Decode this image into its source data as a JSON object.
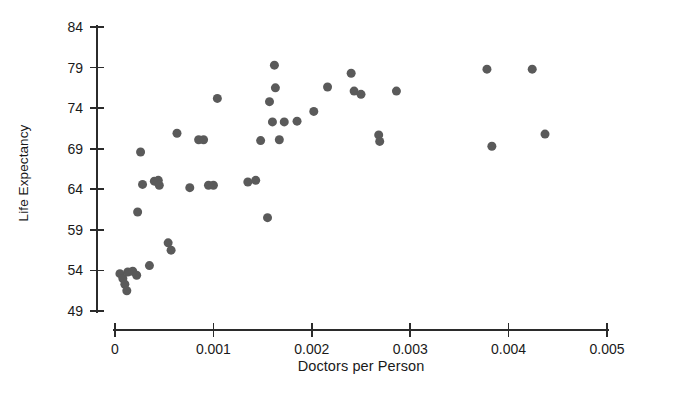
{
  "chart_data": {
    "type": "scatter",
    "title": "",
    "xlabel": "Doctors per Person",
    "ylabel": "Life Expectancy",
    "xlim": [
      0,
      0.005
    ],
    "ylim": [
      49,
      84
    ],
    "xticks": [
      "0",
      "0.001",
      "0.002",
      "0.003",
      "0.004",
      "0.005"
    ],
    "xtick_values": [
      0,
      0.001,
      0.002,
      0.003,
      0.004,
      0.005
    ],
    "yticks": [
      "49",
      "54",
      "59",
      "64",
      "69",
      "74",
      "79",
      "84"
    ],
    "ytick_values": [
      49,
      54,
      59,
      64,
      69,
      74,
      79,
      84
    ],
    "grid": false,
    "legend": null,
    "marker": {
      "shape": "circle",
      "color": "#5a5a5a",
      "size_px": 9
    },
    "point_count": 45,
    "points": [
      {
        "x": 5e-05,
        "y": 53.6
      },
      {
        "x": 8e-05,
        "y": 53.0
      },
      {
        "x": 0.0001,
        "y": 52.3
      },
      {
        "x": 0.00012,
        "y": 51.5
      },
      {
        "x": 0.00013,
        "y": 53.8
      },
      {
        "x": 0.00018,
        "y": 53.9
      },
      {
        "x": 0.00022,
        "y": 53.4
      },
      {
        "x": 0.00023,
        "y": 61.2
      },
      {
        "x": 0.00026,
        "y": 68.6
      },
      {
        "x": 0.00028,
        "y": 64.6
      },
      {
        "x": 0.00035,
        "y": 54.6
      },
      {
        "x": 0.0004,
        "y": 65.0
      },
      {
        "x": 0.00044,
        "y": 65.1
      },
      {
        "x": 0.00045,
        "y": 64.5
      },
      {
        "x": 0.00054,
        "y": 57.4
      },
      {
        "x": 0.00057,
        "y": 56.5
      },
      {
        "x": 0.00063,
        "y": 70.9
      },
      {
        "x": 0.00076,
        "y": 64.2
      },
      {
        "x": 0.00085,
        "y": 70.1
      },
      {
        "x": 0.0009,
        "y": 70.1
      },
      {
        "x": 0.00095,
        "y": 64.5
      },
      {
        "x": 0.001,
        "y": 64.5
      },
      {
        "x": 0.00104,
        "y": 75.2
      },
      {
        "x": 0.00135,
        "y": 64.9
      },
      {
        "x": 0.00143,
        "y": 65.1
      },
      {
        "x": 0.00148,
        "y": 70.0
      },
      {
        "x": 0.00155,
        "y": 60.5
      },
      {
        "x": 0.00157,
        "y": 74.8
      },
      {
        "x": 0.0016,
        "y": 72.3
      },
      {
        "x": 0.00162,
        "y": 79.3
      },
      {
        "x": 0.00163,
        "y": 76.5
      },
      {
        "x": 0.00167,
        "y": 70.1
      },
      {
        "x": 0.00172,
        "y": 72.3
      },
      {
        "x": 0.00185,
        "y": 72.4
      },
      {
        "x": 0.00202,
        "y": 73.6
      },
      {
        "x": 0.00216,
        "y": 76.6
      },
      {
        "x": 0.0024,
        "y": 78.3
      },
      {
        "x": 0.00243,
        "y": 76.1
      },
      {
        "x": 0.0025,
        "y": 75.7
      },
      {
        "x": 0.00268,
        "y": 70.7
      },
      {
        "x": 0.00269,
        "y": 69.9
      },
      {
        "x": 0.00286,
        "y": 76.1
      },
      {
        "x": 0.00378,
        "y": 78.8
      },
      {
        "x": 0.00383,
        "y": 69.3
      },
      {
        "x": 0.00424,
        "y": 78.8
      },
      {
        "x": 0.00437,
        "y": 70.8
      }
    ]
  },
  "figure": {
    "background_color": "#ffffff",
    "axis_color": "#2b2b2b"
  }
}
